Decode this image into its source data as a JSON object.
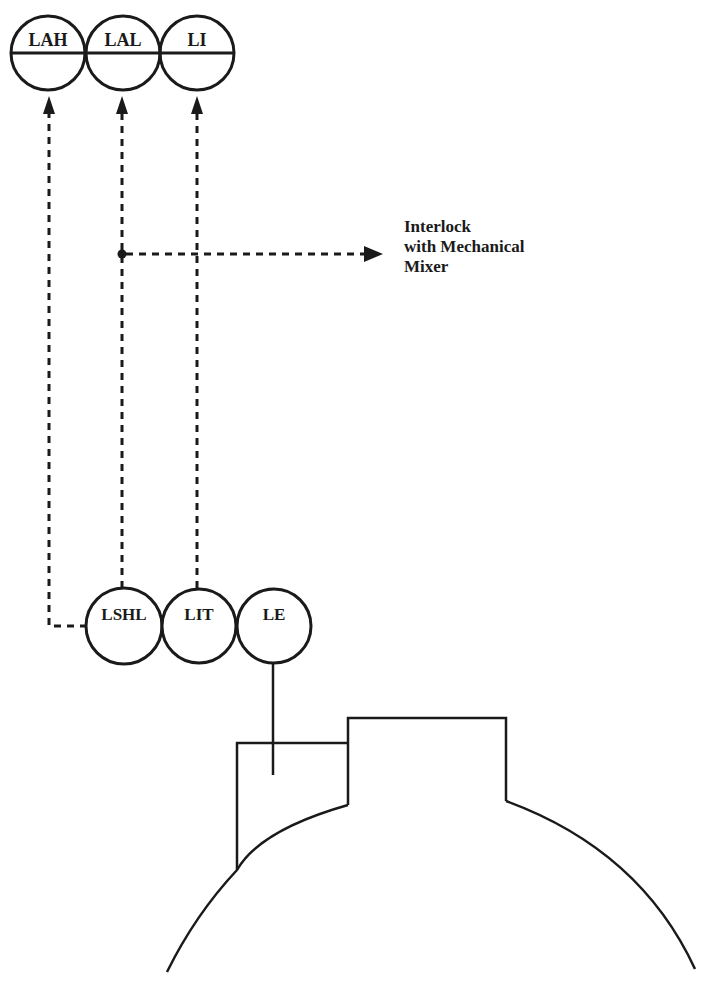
{
  "diagram": {
    "type": "instrumentation-loop",
    "top_instruments": [
      {
        "tag": "LAH",
        "cx": 48,
        "cy": 53
      },
      {
        "tag": "LAL",
        "cx": 123,
        "cy": 53
      },
      {
        "tag": "LI",
        "cx": 197,
        "cy": 53
      }
    ],
    "bottom_instruments": [
      {
        "tag": "LSHL",
        "cx": 124,
        "cy": 626
      },
      {
        "tag": "LIT",
        "cx": 199,
        "cy": 626
      },
      {
        "tag": "LE",
        "cx": 274,
        "cy": 626
      }
    ],
    "annotation": {
      "lines": [
        "Interlock",
        "with Mechanical",
        "Mixer"
      ]
    },
    "colors": {
      "line": "#1a1a1a",
      "background": "#ffffff"
    }
  }
}
